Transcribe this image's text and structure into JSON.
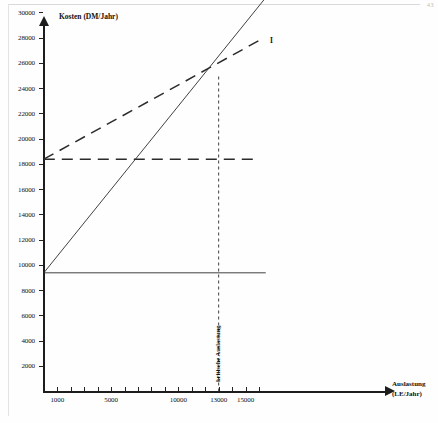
{
  "axes": {
    "y_title": "Kosten (DM/Jahr)",
    "x_title_line1": "Auslastung",
    "x_title_line2": "(LE/Jahr)"
  },
  "annotations": {
    "critical_label": "kritische Auslastung",
    "series_1_label": "I",
    "series_2_label": "II"
  },
  "chart_data": {
    "type": "line",
    "title": "",
    "xlabel": "Auslastung (LE/Jahr)",
    "ylabel": "Kosten (DM/Jahr)",
    "xlim": [
      0,
      17000
    ],
    "ylim": [
      0,
      34000
    ],
    "grid": false,
    "legend_position": "right-end-of-line",
    "xticks": [
      1000,
      2000,
      3000,
      4000,
      5000,
      6000,
      7000,
      8000,
      9000,
      10000,
      11000,
      12000,
      13000,
      14000,
      15000,
      16000
    ],
    "xtick_labels": [
      "1000",
      "",
      "",
      "",
      "5000",
      "",
      "",
      "",
      "",
      "10000",
      "",
      "",
      "13000",
      "",
      "15000",
      ""
    ],
    "yticks": [
      2000,
      4000,
      6000,
      8000,
      10000,
      12000,
      14000,
      16000,
      18000,
      20000,
      22000,
      24000,
      26000,
      28000,
      30000,
      32000,
      34000
    ],
    "ytick_labels": [
      "2000",
      "4000",
      "6000",
      "8000",
      "10000",
      "12000",
      "14000",
      "16000",
      "18000",
      "20000",
      "22000",
      "24000",
      "26000",
      "28000",
      "30000",
      "",
      ""
    ],
    "series": [
      {
        "name": "I",
        "style": "dashed",
        "description": "Gesamtkosten Alternative I",
        "fixed_cost": 18400,
        "x": [
          0,
          16000
        ],
        "values": [
          18400,
          27800
        ]
      },
      {
        "name": "I fixed",
        "style": "dashed",
        "description": "Fixkosten Alternative I",
        "x": [
          0,
          16000
        ],
        "values": [
          18400,
          18400
        ]
      },
      {
        "name": "II",
        "style": "solid",
        "description": "Gesamtkosten Alternative II",
        "fixed_cost": 9400,
        "x": [
          0,
          16500
        ],
        "values": [
          9400,
          31200
        ]
      },
      {
        "name": "II fixed",
        "style": "solid",
        "description": "Fixkosten Alternative II",
        "x": [
          0,
          16500
        ],
        "values": [
          9400,
          9400
        ]
      }
    ],
    "annotations": [
      {
        "type": "vline",
        "label": "kritische Auslastung",
        "x": 13000,
        "y_from": 0,
        "y_to": 25000,
        "style": "dashed"
      },
      {
        "type": "point",
        "label": "Schnittpunkt",
        "x": 13000,
        "y": 25000
      }
    ]
  }
}
